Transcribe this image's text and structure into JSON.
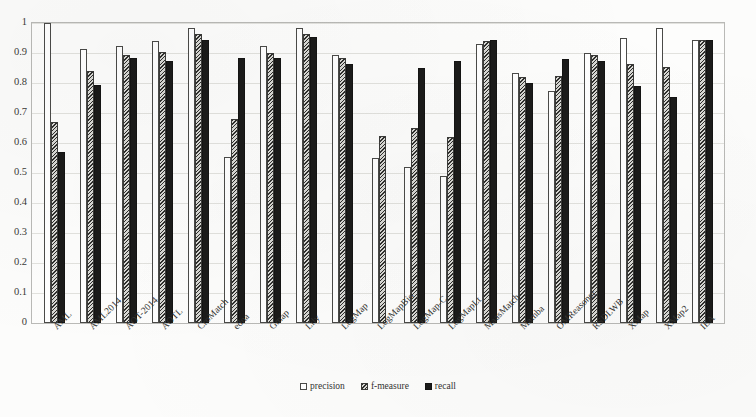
{
  "chart_data": {
    "type": "bar",
    "title": "",
    "subtitle": "",
    "xlabel": "",
    "ylabel": "",
    "ylim": [
      0,
      1
    ],
    "yticks": [
      "1",
      "0.9",
      "0.8",
      "0.7",
      "0.6",
      "0.5",
      "0.4",
      "0.3",
      "0.2",
      "0.1",
      "0"
    ],
    "ytick_values": [
      1,
      0.9,
      0.8,
      0.7,
      0.6,
      0.5,
      0.4,
      0.3,
      0.2,
      0.1,
      0
    ],
    "grid": true,
    "legend_position": "bottom-center",
    "categories": [
      "AML",
      "AML2014",
      "AOT-2014",
      "AOTL",
      "CroMatch",
      "edna",
      "Gmap",
      "Lily",
      "LogMap",
      "LogMapBio",
      "LogMap-C",
      "LogMapLt",
      "MaasMatch",
      "Mamba",
      "OMReasoner",
      "RSDLWB",
      "XMap",
      "XMap2",
      "IEA"
    ],
    "series": [
      {
        "name": "precision",
        "fill": "white-outline",
        "values": [
          1.0,
          0.915,
          0.925,
          0.94,
          0.985,
          0.555,
          0.925,
          0.985,
          0.895,
          0.55,
          0.52,
          0.49,
          0.93,
          0.835,
          0.775,
          0.9,
          0.95,
          0.985,
          0.945
        ]
      },
      {
        "name": "f-measure",
        "fill": "hatched-gray",
        "values": [
          0.67,
          0.84,
          0.895,
          0.905,
          0.965,
          0.68,
          0.9,
          0.965,
          0.885,
          0.625,
          0.65,
          0.62,
          0.94,
          0.82,
          0.825,
          0.895,
          0.865,
          0.855,
          0.945
        ]
      },
      {
        "name": "recall",
        "fill": "black",
        "values": [
          0.57,
          0.795,
          0.885,
          0.875,
          0.945,
          0.885,
          0.885,
          0.955,
          0.865,
          0.0,
          0.85,
          0.875,
          0.945,
          0.8,
          0.88,
          0.875,
          0.79,
          0.755,
          0.945
        ]
      }
    ],
    "legend": [
      "precision",
      "f-measure",
      "recall"
    ]
  }
}
